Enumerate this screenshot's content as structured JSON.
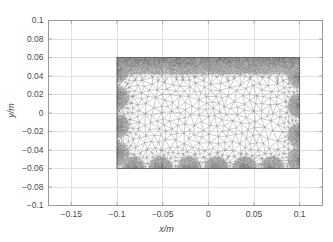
{
  "chart_data": {
    "type": "scatter",
    "title": "",
    "subtitle": "",
    "xlabel": "x/m",
    "ylabel": "y/m",
    "xlim": [
      -0.175,
      0.125
    ],
    "ylim": [
      -0.1,
      0.1
    ],
    "xticks": [
      -0.15,
      -0.1,
      -0.05,
      0,
      0.05,
      0.1
    ],
    "xticklabels": [
      "-0.15",
      "-0.1",
      "-0.05",
      "0",
      "0.05",
      "0.1"
    ],
    "yticks": [
      0.1,
      0.08,
      0.06,
      0.04,
      0.02,
      0,
      -0.02,
      -0.04,
      -0.06,
      -0.08,
      -0.1
    ],
    "yticklabels": [
      "0.1",
      "0.08",
      "0.06",
      "0.04",
      "0.02",
      "0",
      "-0.02",
      "-0.04",
      "-0.06",
      "-0.08",
      "-0.1"
    ],
    "grid": true,
    "legend": null,
    "series": [
      {
        "name": "triangular finite-element mesh",
        "kind": "mesh",
        "domain": {
          "x_min": -0.1,
          "x_max": 0.1,
          "y_min": -0.06,
          "y_max": 0.06
        },
        "description": "Unstructured triangular mesh over a rectangular domain, strongly refined along all four boundaries with localized dense clusters on the left, right and bottom edges and a continuous dense band along the top edge; coarse elements in the interior.",
        "refinement": {
          "interior_element_size": 0.0075,
          "boundary_element_size": 0.0014,
          "top_band_thickness": 0.012,
          "side_band_thickness": 0.011,
          "bottom_band_thickness": 0.011
        },
        "boundary_clusters": {
          "bottom_y": -0.06,
          "bottom_x": [
            -0.082,
            -0.052,
            -0.021,
            0.009,
            0.04,
            0.07
          ],
          "left_x": -0.1,
          "left_y": [
            0.046,
            0.016,
            -0.014,
            -0.044
          ],
          "right_x": 0.1,
          "right_y": [
            0.04,
            0.008,
            -0.024,
            -0.05
          ]
        }
      }
    ],
    "colors": {
      "mesh_line": "#707070",
      "mesh_dense": "#4a4a4a",
      "grid": "#d8d8d8",
      "axes": "#9a9a9a",
      "text": "#4a4a4a",
      "background": "#ffffff"
    }
  },
  "axes": {
    "x_title": "x/m",
    "y_title": "y/m"
  }
}
